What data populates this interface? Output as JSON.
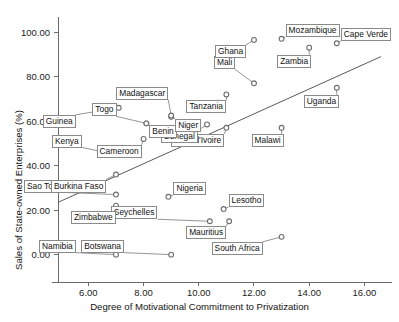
{
  "chart_data": {
    "type": "scatter",
    "title": "",
    "xlabel": "Degree of Motivational Commitment to Privatization",
    "ylabel": "Sales of State-owned Enterprises (%)",
    "xlim": [
      4.9,
      17.0
    ],
    "ylim": [
      -6.0,
      105.0
    ],
    "xticks": [
      "6.00",
      "8.00",
      "10.00",
      "12.00",
      "14.00",
      "16.00"
    ],
    "xtick_values": [
      6,
      8,
      10,
      12,
      14,
      16
    ],
    "yticks": [
      "0.00",
      "20.00",
      "40.00",
      "60.00",
      "80.00",
      "100.00"
    ],
    "ytick_values": [
      0,
      20,
      40,
      60,
      80,
      100
    ],
    "grid": false,
    "legend": "none",
    "marker": "open-circle",
    "fit_line": {
      "label": "linear-fit",
      "x_start": 4.9,
      "y_start": 23.5,
      "x_end": 16.6,
      "y_end": 89.0
    },
    "points": [
      {
        "label": "Namibia",
        "x": 7.0,
        "y": 0.0,
        "lx": -44,
        "ly": -6
      },
      {
        "label": "Botswana",
        "x": 9.0,
        "y": 0.0,
        "lx": -51,
        "ly": -6
      },
      {
        "label": "South Africa",
        "x": 13.0,
        "y": 8.0,
        "lx": -23,
        "ly": 5
      },
      {
        "label": "Mauritius",
        "x": 11.1,
        "y": 15.0,
        "lx": -7,
        "ly": 5
      },
      {
        "label": "Seychelles",
        "x": 10.4,
        "y": 15.0,
        "lx": -56,
        "ly": -6
      },
      {
        "label": "Lesotho",
        "x": 10.9,
        "y": 20.5,
        "lx": 5,
        "ly": -6
      },
      {
        "label": "Zimbabwe",
        "x": 7.0,
        "y": 22.0,
        "lx": -4,
        "ly": 5
      },
      {
        "label": "Nigeria",
        "x": 8.9,
        "y": 26.0,
        "lx": 5,
        "ly": -6
      },
      {
        "label": "Sao Tome",
        "x": 7.0,
        "y": 27.0,
        "lx": -52,
        "ly": -6
      },
      {
        "label": "Burkina Faso",
        "x": 7.0,
        "y": 36.0,
        "lx": -14,
        "ly": 5
      },
      {
        "label": "Kenya",
        "x": 7.0,
        "y": 45.0,
        "lx": -38,
        "ly": -11
      },
      {
        "label": "Cameroon",
        "x": 8.0,
        "y": 52.0,
        "lx": -6,
        "ly": 6
      },
      {
        "label": "Cote d'Ivoire",
        "x": 11.0,
        "y": 57.0,
        "lx": -6,
        "ly": 6
      },
      {
        "label": "Malawi",
        "x": 13.0,
        "y": 57.0,
        "lx": -2,
        "ly": 6
      },
      {
        "label": "Senegal",
        "x": 10.3,
        "y": 58.5,
        "lx": -13,
        "ly": 6
      },
      {
        "label": "Togo",
        "x": 8.1,
        "y": 59.0,
        "lx": -34,
        "ly": -11
      },
      {
        "label": "Benin",
        "x": 8.1,
        "y": 59.0,
        "lx": 3,
        "ly": 2
      },
      {
        "label": "Niger",
        "x": 9.0,
        "y": 62.0,
        "lx": 4,
        "ly": 2
      },
      {
        "label": "Madagascar",
        "x": 9.0,
        "y": 62.5,
        "lx": -7,
        "ly": -20
      },
      {
        "label": "Guinea",
        "x": 7.1,
        "y": 66.0,
        "lx": -47,
        "ly": 7
      },
      {
        "label": "Tanzania",
        "x": 11.0,
        "y": 72.0,
        "lx": -4,
        "ly": 6
      },
      {
        "label": "Mali",
        "x": 12.0,
        "y": 77.0,
        "lx": -23,
        "ly": -18
      },
      {
        "label": "Uganda",
        "x": 15.0,
        "y": 75.0,
        "lx": -2,
        "ly": 7
      },
      {
        "label": "Zambia",
        "x": 14.0,
        "y": 93.0,
        "lx": -2,
        "ly": 7
      },
      {
        "label": "Cape Verde",
        "x": 15.0,
        "y": 95.0,
        "lx": 4,
        "ly": -6
      },
      {
        "label": "Ghana",
        "x": 12.0,
        "y": 96.5,
        "lx": -12,
        "ly": 5
      },
      {
        "label": "Mozambique",
        "x": 13.0,
        "y": 97.0,
        "lx": 4,
        "ly": -6
      }
    ]
  }
}
